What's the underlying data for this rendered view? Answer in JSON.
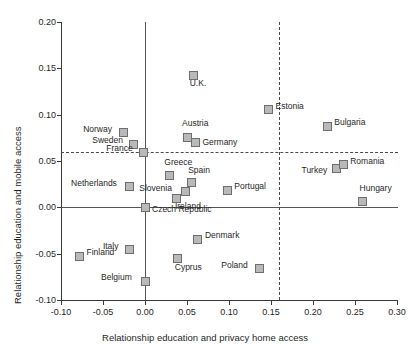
{
  "chart_data": {
    "type": "scatter",
    "title": "",
    "xlabel": "Relationship education and privacy home access",
    "ylabel": "Relationship education and mobile access",
    "xlim": [
      -0.1,
      0.3
    ],
    "ylim": [
      -0.1,
      0.2
    ],
    "xticks": [
      "-0.10",
      "-0.05",
      "0.00",
      "0.05",
      "0.10",
      "0.15",
      "0.20",
      "0.25",
      "0.30"
    ],
    "xtick_values": [
      -0.1,
      -0.05,
      0.0,
      0.05,
      0.1,
      0.15,
      0.2,
      0.25,
      0.3
    ],
    "yticks": [
      "0.20",
      "0.15",
      "0.10",
      "0.05",
      "0.00",
      "-0.05",
      "-0.10"
    ],
    "ytick_values": [
      0.2,
      0.15,
      0.1,
      0.05,
      0.0,
      -0.05,
      -0.1
    ],
    "grid": false,
    "legend": "none",
    "reference_lines": {
      "horizontal_dashed_y": 0.06,
      "vertical_dashed_x": 0.16,
      "horizontal_solid_y": 0.0,
      "vertical_solid_x": 0.0
    },
    "points": [
      {
        "name": "U.K.",
        "x": 0.058,
        "y": 0.1425,
        "label_dx": -4,
        "label_dy": 8
      },
      {
        "name": "Estonia",
        "x": 0.147,
        "y": 0.1055,
        "label_dx": 7,
        "label_dy": -4
      },
      {
        "name": "Bulgaria",
        "x": 0.217,
        "y": 0.0875,
        "label_dx": 7,
        "label_dy": -4
      },
      {
        "name": "Norway",
        "x": -0.026,
        "y": 0.0805,
        "label_dx": -40,
        "label_dy": -4
      },
      {
        "name": "Austria",
        "x": 0.05,
        "y": 0.0755,
        "label_dx": -5,
        "label_dy": -14
      },
      {
        "name": "Germany",
        "x": 0.06,
        "y": 0.07,
        "label_dx": 7,
        "label_dy": 0
      },
      {
        "name": "Sweden",
        "x": -0.014,
        "y": 0.068,
        "label_dx": -41,
        "label_dy": -4
      },
      {
        "name": "France",
        "x": -0.002,
        "y": 0.0595,
        "label_dx": -37,
        "label_dy": -4
      },
      {
        "name": "Turkey",
        "x": 0.228,
        "y": 0.0415,
        "label_dx": -35,
        "label_dy": 1
      },
      {
        "name": "Romania",
        "x": 0.236,
        "y": 0.046,
        "label_dx": 7,
        "label_dy": -4
      },
      {
        "name": "Greece",
        "x": 0.029,
        "y": 0.0345,
        "label_dx": -5,
        "label_dy": -13
      },
      {
        "name": "Spain",
        "x": 0.055,
        "y": 0.0265,
        "label_dx": -3,
        "label_dy": -13
      },
      {
        "name": "Netherlands",
        "x": -0.019,
        "y": 0.022,
        "label_dx": -58,
        "label_dy": -4
      },
      {
        "name": "Slovenia",
        "x": 0.048,
        "y": 0.0175,
        "label_dx": -46,
        "label_dy": -3
      },
      {
        "name": "Portugal",
        "x": 0.098,
        "y": 0.0185,
        "label_dx": 7,
        "label_dy": -4
      },
      {
        "name": "Ireland",
        "x": 0.038,
        "y": 0.01,
        "label_dx": -2,
        "label_dy": 8
      },
      {
        "name": "Hungary",
        "x": 0.259,
        "y": 0.0065,
        "label_dx": -3,
        "label_dy": -13
      },
      {
        "name": "Czech Republic",
        "x": 0.0,
        "y": 0.0,
        "label_dx": 7,
        "label_dy": 2
      },
      {
        "name": "Denmark",
        "x": 0.063,
        "y": -0.0345,
        "label_dx": 7,
        "label_dy": -4
      },
      {
        "name": "Italy",
        "x": -0.018,
        "y": -0.046,
        "label_dx": -27,
        "label_dy": -4
      },
      {
        "name": "Finland",
        "x": -0.078,
        "y": -0.053,
        "label_dx": 7,
        "label_dy": -4
      },
      {
        "name": "Cyprus",
        "x": 0.039,
        "y": -0.0555,
        "label_dx": -3,
        "label_dy": 8
      },
      {
        "name": "Poland",
        "x": 0.136,
        "y": -0.0665,
        "label_dx": -38,
        "label_dy": -4
      },
      {
        "name": "Belgium",
        "x": 0.0,
        "y": -0.08,
        "label_dx": -44,
        "label_dy": -4
      }
    ]
  }
}
